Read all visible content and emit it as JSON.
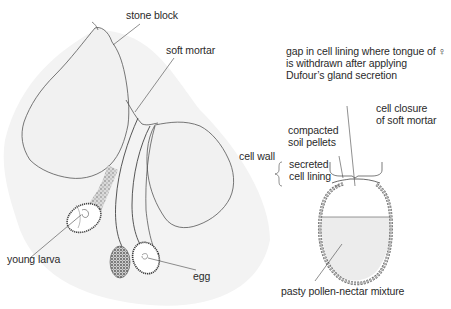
{
  "left_figure": {
    "labels": {
      "stone_block": "stone block",
      "soft_mortar": "soft mortar",
      "young_larva": "young larva",
      "egg": "egg"
    }
  },
  "right_figure": {
    "labels": {
      "gap_note": "gap in cell lining where tongue of ♀\nis withdrawn after applying\nDufour’s gland secretion",
      "cell_closure": "cell closure\nof soft mortar",
      "cell_wall": "cell wall",
      "compacted_soil": "compacted\nsoil pellets",
      "secreted_lining": "secreted\ncell lining",
      "pollen_mixture": "pasty pollen-nectar mixture"
    }
  },
  "colors": {
    "ink": "#3a3a3a",
    "stone_fill": "#f2f2f2",
    "shadow": "#e4e4e4",
    "pollen_fill": "#ebebeb",
    "soil_fill": "#bdbdbd"
  }
}
